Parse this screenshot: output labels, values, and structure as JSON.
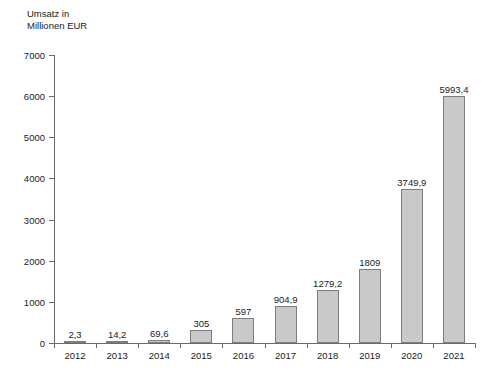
{
  "chart_data": {
    "type": "bar",
    "title": "",
    "ylabel": "Umsatz in\nMillionen EUR",
    "ylabel_line1": "Umsatz in",
    "ylabel_line2": "Millionen EUR",
    "xlabel": "",
    "categories": [
      "2012",
      "2013",
      "2014",
      "2015",
      "2016",
      "2017",
      "2018",
      "2019",
      "2020",
      "2021"
    ],
    "values": [
      2.3,
      14.2,
      69.6,
      305,
      597,
      904.9,
      1279.2,
      1809,
      3749.9,
      5993.4
    ],
    "value_labels": [
      "2,3",
      "14,2",
      "69,6",
      "305",
      "597",
      "904,9",
      "1279,2",
      "1809",
      "3749,9",
      "5993,4"
    ],
    "ylim": [
      0,
      7000
    ],
    "ytick_values": [
      0,
      1000,
      2000,
      3000,
      4000,
      5000,
      6000,
      7000
    ],
    "ytick_labels": [
      "0",
      "1000",
      "2000",
      "3000",
      "4000",
      "5000",
      "6000",
      "7000"
    ],
    "grid": false,
    "legend": false,
    "bar_color": "#c9c9c9",
    "bar_border_color": "#7d7d7d",
    "axis_color": "#6b6b6b",
    "text_color": "#1a1a1a",
    "background": "#ffffff"
  }
}
